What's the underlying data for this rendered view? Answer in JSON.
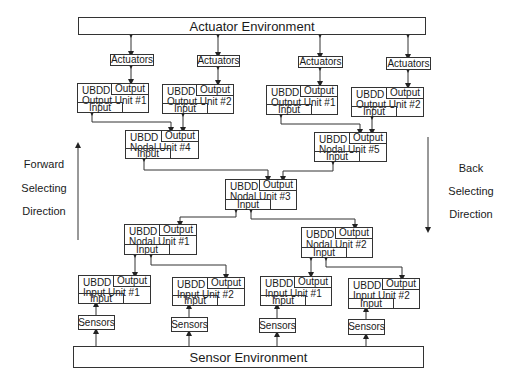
{
  "environments": {
    "actuator": "Actuator Environment",
    "sensor": "Sensor Environment"
  },
  "actuators": [
    "Actuators",
    "Actuators",
    "Actuators",
    "Actuators"
  ],
  "sensors": [
    "Sensors",
    "Sensors",
    "Sensors",
    "Sensors"
  ],
  "unit_labels": {
    "ubdd": "UBDD",
    "output": "Output",
    "input": "Input"
  },
  "output_units": [
    {
      "name": "Output Unit #1"
    },
    {
      "name": "Output Unit #2"
    },
    {
      "name": "Output Unit #1"
    },
    {
      "name": "Output Unit #2"
    }
  ],
  "nodal_units": {
    "n4": "Nodal Unit #4",
    "n5": "Nodal Unit #5",
    "n3": "Nodal Unit #3",
    "n1": "Nodal Unit #1",
    "n2": "Nodal Unit #2"
  },
  "input_units": [
    {
      "name": "Input Unit #1"
    },
    {
      "name": "Input Unit #2"
    },
    {
      "name": "Input Unit #1"
    },
    {
      "name": "Input Unit #2"
    }
  ],
  "directions": {
    "forward": [
      "Forward",
      "Selecting",
      "Direction"
    ],
    "back": [
      "Back",
      "Selecting",
      "Direction"
    ]
  },
  "colors": {
    "line": "#333333",
    "background": "#ffffff"
  }
}
